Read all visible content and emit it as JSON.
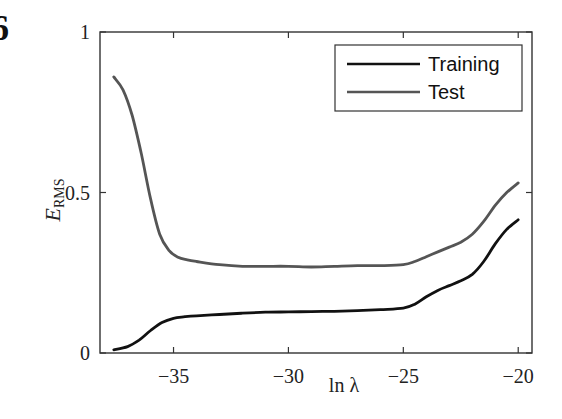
{
  "chart_data": {
    "type": "line",
    "title": "",
    "xlabel": "ln λ",
    "ylabel": "E_RMS",
    "ylabel_main": "E",
    "ylabel_sub": "RMS",
    "xlim": [
      -38.2,
      -19.4
    ],
    "ylim": [
      0,
      1
    ],
    "xticks": [
      -35,
      -30,
      -25,
      -20
    ],
    "xtick_labels": [
      "−35",
      "−30",
      "−25",
      "−20"
    ],
    "yticks": [
      0,
      0.5,
      1
    ],
    "ytick_labels": [
      "0",
      "0.5",
      "1"
    ],
    "grid": false,
    "legend_position": "upper right",
    "series": [
      {
        "name": "Training",
        "color": "#111111",
        "x": [
          -37.6,
          -37.0,
          -36.5,
          -36.0,
          -35.5,
          -35.0,
          -34.5,
          -34.0,
          -33.0,
          -32.0,
          -31.0,
          -30.0,
          -29.0,
          -28.0,
          -27.0,
          -26.0,
          -25.0,
          -24.5,
          -24.0,
          -23.5,
          -23.0,
          -22.5,
          -22.0,
          -21.5,
          -21.0,
          -20.5,
          -20.0
        ],
        "values": [
          0.01,
          0.02,
          0.04,
          0.07,
          0.095,
          0.108,
          0.113,
          0.116,
          0.12,
          0.124,
          0.127,
          0.128,
          0.129,
          0.13,
          0.132,
          0.135,
          0.14,
          0.152,
          0.175,
          0.195,
          0.21,
          0.225,
          0.245,
          0.285,
          0.34,
          0.385,
          0.415
        ]
      },
      {
        "name": "Test",
        "color": "#555555",
        "x": [
          -37.6,
          -37.2,
          -36.8,
          -36.4,
          -36.0,
          -35.6,
          -35.2,
          -34.8,
          -34.4,
          -34.0,
          -33.0,
          -32.0,
          -31.0,
          -30.0,
          -29.0,
          -28.0,
          -27.0,
          -26.0,
          -25.0,
          -24.5,
          -24.0,
          -23.5,
          -23.0,
          -22.5,
          -22.0,
          -21.5,
          -21.0,
          -20.5,
          -20.0
        ],
        "values": [
          0.86,
          0.82,
          0.74,
          0.62,
          0.48,
          0.37,
          0.32,
          0.298,
          0.29,
          0.285,
          0.275,
          0.27,
          0.27,
          0.27,
          0.268,
          0.27,
          0.272,
          0.272,
          0.275,
          0.285,
          0.3,
          0.315,
          0.33,
          0.345,
          0.37,
          0.41,
          0.46,
          0.5,
          0.53
        ]
      }
    ]
  },
  "panel_marker": "6"
}
